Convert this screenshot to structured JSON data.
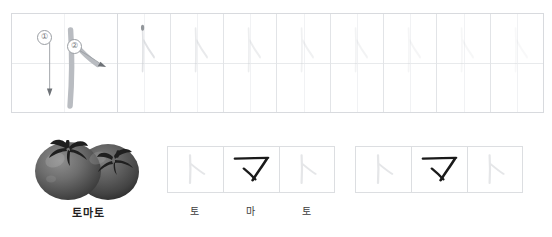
{
  "worksheet": {
    "target_letter": "ㅏ",
    "target_letter_name": "a",
    "stroke_order_badges": [
      "①",
      "②"
    ],
    "practice_cells": [
      {
        "guide_opacity": 0.55,
        "has_start_dot": true
      },
      {
        "guide_opacity": 0.4,
        "has_start_dot": false
      },
      {
        "guide_opacity": 0.33,
        "has_start_dot": false
      },
      {
        "guide_opacity": 0.27,
        "has_start_dot": false
      },
      {
        "guide_opacity": 0.22,
        "has_start_dot": false
      },
      {
        "guide_opacity": 0.18,
        "has_start_dot": false
      },
      {
        "guide_opacity": 0.15,
        "has_start_dot": false
      },
      {
        "guide_opacity": 0.12,
        "has_start_dot": false
      }
    ]
  },
  "picture": {
    "icon": "tomato-illustration",
    "caption": "토마토"
  },
  "word_groups": [
    {
      "name": "traced-word",
      "cells": [
        {
          "glyph": "ㅏ",
          "ink": "light",
          "label": "토"
        },
        {
          "glyph": "ㅁ",
          "ink": "dark",
          "label": "마"
        },
        {
          "glyph": "ㅏ",
          "ink": "light",
          "label": "토"
        }
      ]
    },
    {
      "name": "practice-word",
      "cells": [
        {
          "glyph": "ㅏ",
          "ink": "light",
          "label": ""
        },
        {
          "glyph": "ㅁ",
          "ink": "dark",
          "label": ""
        },
        {
          "glyph": "ㅏ",
          "ink": "light",
          "label": ""
        }
      ]
    }
  ],
  "colors": {
    "grid_border": "#d8dade",
    "grid_inner": "#e2e4e7",
    "guide_stroke": "#c9ccd1",
    "demo_stroke": "#b9bcc1",
    "ink_dark": "#1a1a1a",
    "caption_text": "#231f20",
    "label_text": "#3c3c3c"
  }
}
